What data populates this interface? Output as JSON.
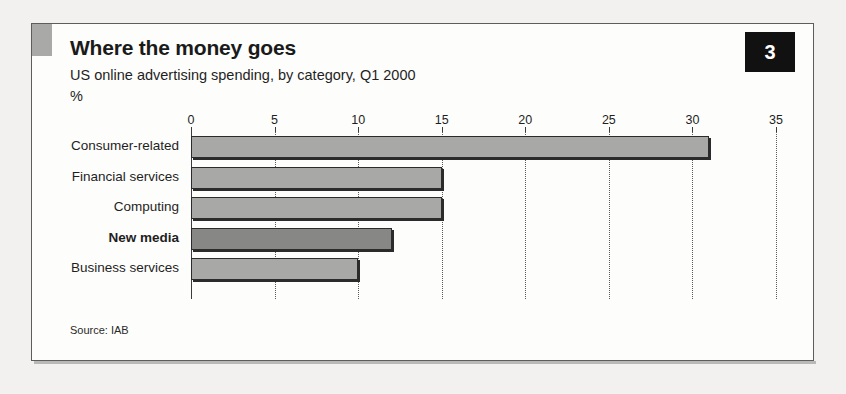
{
  "figure": {
    "title": "Where the money goes",
    "subtitle": "US online advertising spending, by category, Q1 2000",
    "unit": "%",
    "badge": "3",
    "source": "Source: IAB"
  },
  "chart_data": {
    "type": "bar",
    "orientation": "horizontal",
    "title": "Where the money goes",
    "subtitle": "US online advertising spending, by category, Q1 2000",
    "xlabel": "%",
    "ylabel": "",
    "categories": [
      "Consumer-related",
      "Financial services",
      "Computing",
      "New media",
      "Business services"
    ],
    "values": [
      31,
      15,
      15,
      12,
      10
    ],
    "highlight_category": "New media",
    "xlim": [
      0,
      35
    ],
    "xticks": [
      0,
      5,
      10,
      15,
      20,
      25,
      30,
      35
    ],
    "grid": "dotted-vertical",
    "legend": "none",
    "bar_color": "#a8a8a6",
    "highlight_color": "#878785",
    "source": "Source: IAB"
  }
}
